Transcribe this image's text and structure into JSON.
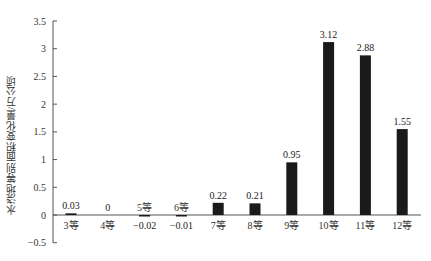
{
  "chart_data": {
    "type": "bar",
    "title": "",
    "xlabel": "",
    "ylabel": "水浇地等别面积变化量/万公顷",
    "categories": [
      "3等",
      "4等",
      "5等",
      "6等",
      "7等",
      "8等",
      "9等",
      "10等",
      "11等",
      "12等"
    ],
    "values": [
      0.03,
      0,
      -0.02,
      -0.01,
      0.22,
      0.21,
      0.95,
      3.12,
      2.88,
      1.55
    ],
    "data_labels": [
      "0.03",
      "0",
      "-0.02",
      "-0.01",
      "0.22",
      "0.21",
      "0.95",
      "3.12",
      "2.88",
      "1.55"
    ],
    "ylim": [
      -0.5,
      3.5
    ],
    "yticks": [
      -0.5,
      0,
      0.5,
      1,
      1.5,
      2,
      2.5,
      3,
      3.5
    ],
    "ytick_labels": [
      "-0.5",
      "0",
      "0.5",
      "1",
      "1.5",
      "2",
      "2.5",
      "3",
      "3.5"
    ],
    "grid": false,
    "legend": null,
    "bar_color": "#1a1a1a",
    "axis_color": "#555555"
  }
}
